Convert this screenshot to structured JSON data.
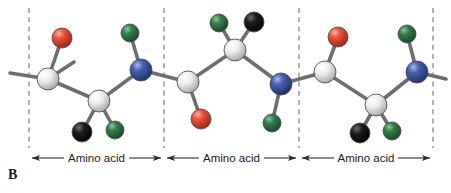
{
  "figure": {
    "panel_label": "B",
    "background_color": "#ffffff",
    "width": 451,
    "height": 193
  },
  "palette": {
    "carbon": "#e8e8ea",
    "carbon_dark": "#9a9a9e",
    "oxygen": "#e8412a",
    "oxygen_dark": "#a62414",
    "nitrogen": "#3b55a8",
    "nitrogen_dark": "#1d2f6b",
    "hydrogen": "#2f7a44",
    "hydrogen_dark": "#17482a",
    "rgroup": "#141414",
    "rgroup_dark": "#000000",
    "bond": "#6e6e70",
    "bond_outline": "#3a3a3c",
    "divider": "#77777a",
    "arrow": "#2b2b2b",
    "text": "#1a1a1a"
  },
  "dividers": [
    {
      "id": "divider-1",
      "x": 29
    },
    {
      "id": "divider-2",
      "x": 164
    },
    {
      "id": "divider-3",
      "x": 299
    },
    {
      "id": "divider-4",
      "x": 433
    }
  ],
  "residue_labels": [
    {
      "id": "residue-label-1",
      "text": "Amino acid",
      "x_start": 29,
      "x_end": 164,
      "y": 158
    },
    {
      "id": "residue-label-2",
      "text": "Amino acid",
      "x_start": 164,
      "x_end": 299,
      "y": 158
    },
    {
      "id": "residue-label-3",
      "text": "Amino acid",
      "x_start": 299,
      "x_end": 433,
      "y": 158
    }
  ],
  "atoms": [
    {
      "id": "c-term-left",
      "element": "C",
      "role": "carbonyl-carbon",
      "cx": 48,
      "cy": 79,
      "r": 11
    },
    {
      "id": "o-1",
      "element": "O",
      "role": "carbonyl-oxygen",
      "cx": 62,
      "cy": 38,
      "r": 10
    },
    {
      "id": "ca-1",
      "element": "C",
      "role": "alpha-carbon",
      "cx": 99,
      "cy": 101,
      "r": 11
    },
    {
      "id": "r-1",
      "element": "R",
      "role": "side-chain-group",
      "cx": 82,
      "cy": 132,
      "r": 10
    },
    {
      "id": "h-1",
      "element": "H",
      "role": "alpha-hydrogen",
      "cx": 115,
      "cy": 130,
      "r": 9
    },
    {
      "id": "n-1",
      "element": "N",
      "role": "amide-nitrogen",
      "cx": 141,
      "cy": 70,
      "r": 11
    },
    {
      "id": "h-n1",
      "element": "H",
      "role": "amide-hydrogen",
      "cx": 130,
      "cy": 33,
      "r": 9
    },
    {
      "id": "c-2",
      "element": "C",
      "role": "carbonyl-carbon",
      "cx": 188,
      "cy": 82,
      "r": 11
    },
    {
      "id": "o-2",
      "element": "O",
      "role": "carbonyl-oxygen",
      "cx": 201,
      "cy": 119,
      "r": 10
    },
    {
      "id": "ca-2",
      "element": "C",
      "role": "alpha-carbon",
      "cx": 235,
      "cy": 50,
      "r": 11
    },
    {
      "id": "h-2",
      "element": "H",
      "role": "alpha-hydrogen",
      "cx": 219,
      "cy": 23,
      "r": 9
    },
    {
      "id": "r-2",
      "element": "R",
      "role": "side-chain-group",
      "cx": 254,
      "cy": 22,
      "r": 10
    },
    {
      "id": "n-2",
      "element": "N",
      "role": "amide-nitrogen",
      "cx": 281,
      "cy": 84,
      "r": 11
    },
    {
      "id": "h-n2",
      "element": "H",
      "role": "amide-hydrogen",
      "cx": 272,
      "cy": 123,
      "r": 9
    },
    {
      "id": "c-3",
      "element": "C",
      "role": "carbonyl-carbon",
      "cx": 325,
      "cy": 72,
      "r": 11
    },
    {
      "id": "o-3",
      "element": "O",
      "role": "carbonyl-oxygen",
      "cx": 338,
      "cy": 37,
      "r": 10
    },
    {
      "id": "ca-3",
      "element": "C",
      "role": "alpha-carbon",
      "cx": 376,
      "cy": 105,
      "r": 11
    },
    {
      "id": "r-3",
      "element": "R",
      "role": "side-chain-group",
      "cx": 360,
      "cy": 133,
      "r": 10
    },
    {
      "id": "h-3",
      "element": "H",
      "role": "alpha-hydrogen",
      "cx": 392,
      "cy": 131,
      "r": 9
    },
    {
      "id": "n-3",
      "element": "N",
      "role": "amide-nitrogen",
      "cx": 417,
      "cy": 72,
      "r": 11
    },
    {
      "id": "h-n3",
      "element": "H",
      "role": "amide-hydrogen",
      "cx": 407,
      "cy": 34,
      "r": 9
    }
  ],
  "bonds": [
    {
      "id": "bond-left-stub",
      "from": "free-left",
      "to": "c-term-left"
    },
    {
      "id": "bond-up-stub",
      "from": "c-term-left",
      "to": "free-up-left"
    },
    {
      "id": "bond-c1-o1",
      "from": "c-term-left",
      "to": "o-1"
    },
    {
      "id": "bond-c1-ca1",
      "from": "c-term-left",
      "to": "ca-1"
    },
    {
      "id": "bond-ca1-r1",
      "from": "ca-1",
      "to": "r-1"
    },
    {
      "id": "bond-ca1-h1",
      "from": "ca-1",
      "to": "h-1"
    },
    {
      "id": "bond-ca1-n1",
      "from": "ca-1",
      "to": "n-1"
    },
    {
      "id": "bond-n1-hn1",
      "from": "n-1",
      "to": "h-n1"
    },
    {
      "id": "bond-n1-c2",
      "from": "n-1",
      "to": "c-2"
    },
    {
      "id": "bond-c2-o2",
      "from": "c-2",
      "to": "o-2"
    },
    {
      "id": "bond-c2-ca2",
      "from": "c-2",
      "to": "ca-2"
    },
    {
      "id": "bond-ca2-h2",
      "from": "ca-2",
      "to": "h-2"
    },
    {
      "id": "bond-ca2-r2",
      "from": "ca-2",
      "to": "r-2"
    },
    {
      "id": "bond-ca2-n2",
      "from": "ca-2",
      "to": "n-2"
    },
    {
      "id": "bond-n2-hn2",
      "from": "n-2",
      "to": "h-n2"
    },
    {
      "id": "bond-n2-c3",
      "from": "n-2",
      "to": "c-3"
    },
    {
      "id": "bond-c3-o3",
      "from": "c-3",
      "to": "o-3"
    },
    {
      "id": "bond-c3-ca3",
      "from": "c-3",
      "to": "ca-3"
    },
    {
      "id": "bond-ca3-r3",
      "from": "ca-3",
      "to": "r-3"
    },
    {
      "id": "bond-ca3-h3",
      "from": "ca-3",
      "to": "h-3"
    },
    {
      "id": "bond-ca3-n3",
      "from": "ca-3",
      "to": "n-3"
    },
    {
      "id": "bond-n3-hn3",
      "from": "n-3",
      "to": "h-n3"
    },
    {
      "id": "bond-right-stub",
      "from": "n-3",
      "to": "free-right"
    }
  ]
}
